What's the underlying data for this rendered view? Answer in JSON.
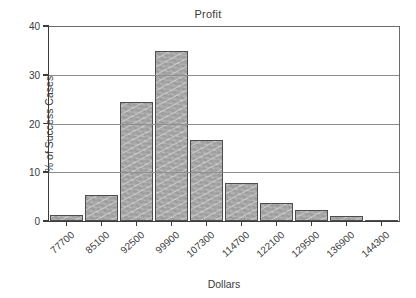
{
  "chart_data": {
    "type": "bar",
    "title": "Profit",
    "xlabel": "Dollars",
    "ylabel": "% of Success Cases",
    "categories": [
      "77700",
      "85100",
      "92500",
      "99900",
      "107300",
      "114700",
      "122100",
      "129500",
      "136900",
      "144300"
    ],
    "values": [
      1.3,
      5.4,
      24.4,
      34.8,
      16.6,
      7.9,
      3.7,
      2.2,
      1.1,
      0.0
    ],
    "ylim": [
      0,
      40
    ],
    "yticks": [
      0,
      10,
      20,
      30,
      40
    ],
    "ytick_labels": [
      "0",
      "10",
      "20",
      "30",
      "40"
    ],
    "grid": "horizontal",
    "legend": "none",
    "bar_color": "#a9a9a9",
    "bar_edge_color": "#4e4e4e",
    "axis_color": "#3c3c3c",
    "grid_color": "#8e8e8e",
    "background_color": "#ffffff",
    "text_color": "#3a3a3a"
  }
}
